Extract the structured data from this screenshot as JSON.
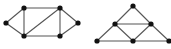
{
  "diagram": {
    "type": "graph-pair",
    "colors": {
      "edge": "#555555",
      "node": "#111111",
      "background": "#ffffff"
    },
    "graphs": [
      {
        "name": "left-graph",
        "nodes": [
          {
            "id": "A",
            "x": 6,
            "y": 23
          },
          {
            "id": "B",
            "x": 24,
            "y": 8
          },
          {
            "id": "C",
            "x": 60,
            "y": 8
          },
          {
            "id": "D",
            "x": 78,
            "y": 23
          },
          {
            "id": "E",
            "x": 24,
            "y": 36
          },
          {
            "id": "F",
            "x": 60,
            "y": 36
          }
        ],
        "edges": [
          [
            "A",
            "B"
          ],
          [
            "A",
            "E"
          ],
          [
            "B",
            "C"
          ],
          [
            "B",
            "E"
          ],
          [
            "E",
            "C"
          ],
          [
            "C",
            "F"
          ],
          [
            "E",
            "F"
          ],
          [
            "C",
            "D"
          ],
          [
            "F",
            "D"
          ]
        ]
      },
      {
        "name": "right-graph",
        "nodes": [
          {
            "id": "T",
            "x": 133,
            "y": 6
          },
          {
            "id": "M1",
            "x": 115,
            "y": 24
          },
          {
            "id": "M2",
            "x": 151,
            "y": 24
          },
          {
            "id": "L",
            "x": 97,
            "y": 41
          },
          {
            "id": "Mb",
            "x": 133,
            "y": 41
          },
          {
            "id": "R",
            "x": 169,
            "y": 41
          }
        ],
        "edges": [
          [
            "T",
            "M1"
          ],
          [
            "T",
            "M2"
          ],
          [
            "M1",
            "M2"
          ],
          [
            "M1",
            "L"
          ],
          [
            "M1",
            "Mb"
          ],
          [
            "M2",
            "Mb"
          ],
          [
            "M2",
            "R"
          ],
          [
            "L",
            "Mb"
          ],
          [
            "Mb",
            "R"
          ]
        ]
      }
    ]
  }
}
